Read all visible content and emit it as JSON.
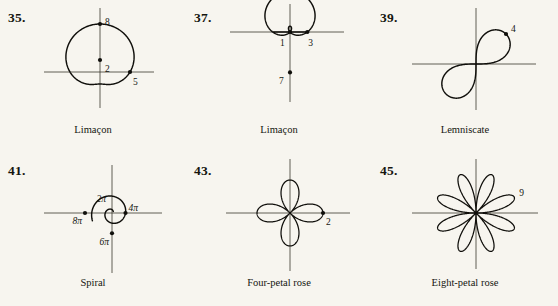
{
  "page": {
    "background_color": "#f7f5ef",
    "ink_color": "#100f0b",
    "axis_color": "#3b382f",
    "columns": 3,
    "rows": 2
  },
  "figures": [
    {
      "number": "35.",
      "caption": "Limaçon",
      "curve_type": "limacon-convex",
      "labels": [
        {
          "text": "8",
          "role": "y-axis-top-intercept"
        },
        {
          "text": "2",
          "role": "y-axis-bottom-intercept"
        },
        {
          "text": "5",
          "role": "x-axis-right-intercept"
        }
      ],
      "chart_data": {
        "type": "line",
        "coordinate_system": "polar",
        "equation_form": "r = a + b*cos(theta)",
        "a": 5,
        "b": 3,
        "description": "Convex limaçon, nearly circular, no dimple",
        "marked_points": [
          {
            "label": "8",
            "theta_deg": 90,
            "r": 8,
            "position": "top"
          },
          {
            "label": "5",
            "theta_deg": 0,
            "r": 5,
            "position": "right"
          },
          {
            "label": "2",
            "theta_deg": 270,
            "r": 2,
            "position": "bottom"
          }
        ],
        "theta_range_deg": [
          0,
          360
        ]
      }
    },
    {
      "number": "37.",
      "caption": "Limaçon",
      "curve_type": "limacon-inner-loop",
      "labels": [
        {
          "text": "1",
          "role": "inner-loop-extent"
        },
        {
          "text": "3",
          "role": "x-axis-right-intercept"
        },
        {
          "text": "7",
          "role": "y-axis-bottom-intercept"
        }
      ],
      "chart_data": {
        "type": "line",
        "coordinate_system": "polar",
        "equation_form": "r = a + b*sin(theta)",
        "a": 3,
        "b": 4,
        "description": "Limaçon with inner loop, cardioid-like cusp at top",
        "marked_points": [
          {
            "label": "1",
            "theta_deg": 90,
            "r": 1,
            "position": "inner-loop-top"
          },
          {
            "label": "3",
            "theta_deg": 0,
            "r": 3,
            "position": "right"
          },
          {
            "label": "7",
            "theta_deg": 270,
            "r": 7,
            "position": "bottom"
          }
        ],
        "theta_range_deg": [
          0,
          360
        ]
      }
    },
    {
      "number": "39.",
      "caption": "Lemniscate",
      "curve_type": "lemniscate",
      "labels": [
        {
          "text": "4",
          "role": "upper-right-tip"
        }
      ],
      "chart_data": {
        "type": "line",
        "coordinate_system": "polar",
        "equation_form": "r^2 = a^2 * sin(2*theta)",
        "a": 4,
        "description": "Figure-eight lemniscate tilted 45 degrees through quadrants I and III",
        "marked_points": [
          {
            "label": "4",
            "theta_deg": 45,
            "r": 4,
            "position": "upper-right"
          }
        ],
        "axis_tilt_deg": 45
      }
    },
    {
      "number": "41.",
      "caption": "Spiral",
      "curve_type": "archimedean-spiral",
      "labels": [
        {
          "text": "2π",
          "role": "first-quarter-turn"
        },
        {
          "text": "4π",
          "role": "second-crossing"
        },
        {
          "text": "6π",
          "role": "third-crossing"
        },
        {
          "text": "8π",
          "role": "fourth-crossing"
        }
      ],
      "chart_data": {
        "type": "line",
        "coordinate_system": "polar",
        "equation_form": "r = theta",
        "description": "Archimedean spiral expanding counterclockwise",
        "marked_points": [
          {
            "label": "2π",
            "theta_deg": 90,
            "r": 6.283,
            "position": "top"
          },
          {
            "label": "4π",
            "theta_deg": 0,
            "r": 12.566,
            "position": "right"
          },
          {
            "label": "6π",
            "theta_deg": 270,
            "r": 18.85,
            "position": "bottom"
          },
          {
            "label": "8π",
            "theta_deg": 180,
            "r": 25.13,
            "position": "left"
          }
        ],
        "theta_range_deg": [
          20,
          560
        ]
      }
    },
    {
      "number": "43.",
      "caption": "Four-petal rose",
      "curve_type": "rose-4-petal",
      "labels": [
        {
          "text": "2",
          "role": "right-petal-tip"
        }
      ],
      "chart_data": {
        "type": "line",
        "coordinate_system": "polar",
        "equation_form": "r = a*cos(2*theta)",
        "a": 2,
        "petal_count": 4,
        "description": "Four-petal rose with petals aligned to the axes",
        "marked_points": [
          {
            "label": "2",
            "theta_deg": 0,
            "r": 2,
            "position": "right"
          }
        ],
        "petal_angles_deg": [
          0,
          90,
          180,
          270
        ]
      }
    },
    {
      "number": "45.",
      "caption": "Eight-petal rose",
      "curve_type": "rose-8-petal",
      "labels": [
        {
          "text": "9",
          "role": "upper-right-petal-tip"
        }
      ],
      "chart_data": {
        "type": "line",
        "coordinate_system": "polar",
        "equation_form": "r = a*cos(4*theta)",
        "a": 9,
        "petal_count": 8,
        "description": "Eight-petal rose, petals offset at 45 degree spacing starting at 22.5 degrees",
        "marked_points": [
          {
            "label": "9",
            "theta_deg": 22.5,
            "r": 9,
            "position": "upper-right"
          }
        ],
        "petal_angles_deg": [
          22.5,
          67.5,
          112.5,
          157.5,
          202.5,
          247.5,
          292.5,
          337.5
        ]
      }
    }
  ]
}
